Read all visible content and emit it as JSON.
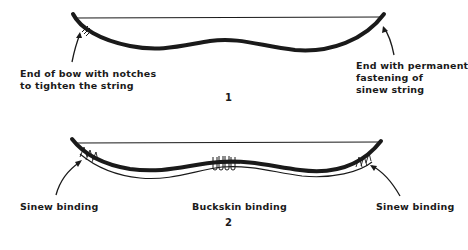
{
  "figure1": {
    "number": "1",
    "label_left": "End of bow with notches\nto tighten the string",
    "label_right": "End with permanent\nfastening of\nsinew string"
  },
  "figure2": {
    "number": "2",
    "label_left": "Sinew binding",
    "label_center": "Buckskin binding",
    "label_right": "Sinew binding"
  },
  "colors": {
    "ink": "#1a1a1a",
    "background": "#ffffff"
  }
}
